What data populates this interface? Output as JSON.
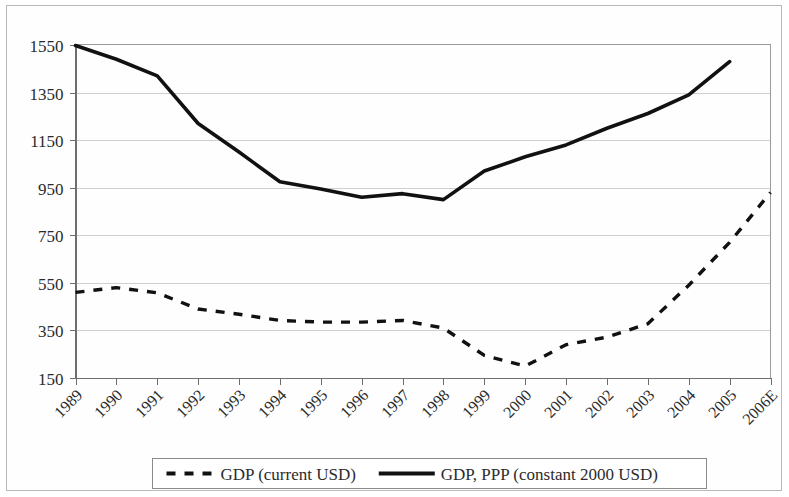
{
  "chart_data": {
    "type": "line",
    "title": "",
    "subtitle": "",
    "xlabel": "",
    "ylabel": "",
    "grid": true,
    "legend_position": "bottom",
    "ylim": [
      150,
      1550
    ],
    "ytick_labels": [
      "150",
      "350",
      "550",
      "750",
      "950",
      "1150",
      "1350",
      "1550"
    ],
    "ytick_values": [
      150,
      350,
      550,
      750,
      950,
      1150,
      1350,
      1550
    ],
    "categories": [
      "1989",
      "1990",
      "1991",
      "1992",
      "1993",
      "1994",
      "1995",
      "1996",
      "1997",
      "1998",
      "1999",
      "2000",
      "2001",
      "2002",
      "2003",
      "2004",
      "2005",
      "2006E"
    ],
    "series": [
      {
        "name": "GDP (current USD)",
        "style": "dashed",
        "color": "#111111",
        "values": [
          510,
          530,
          508,
          440,
          418,
          392,
          385,
          385,
          392,
          360,
          245,
          200,
          290,
          322,
          378,
          540,
          720,
          930
        ]
      },
      {
        "name": "GDP, PPP (constant 2000 USD)",
        "style": "solid",
        "color": "#111111",
        "values": [
          1548,
          1490,
          1420,
          1220,
          1100,
          975,
          945,
          910,
          925,
          900,
          1020,
          1080,
          1130,
          1200,
          1262,
          1340,
          1480,
          null
        ]
      }
    ]
  },
  "legend": {
    "entries": [
      {
        "label": "GDP (current USD)",
        "style": "dashed"
      },
      {
        "label": "GDP, PPP (constant 2000 USD)",
        "style": "solid"
      }
    ]
  }
}
